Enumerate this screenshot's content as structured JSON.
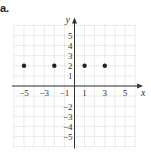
{
  "problem_label": "a.",
  "chart_data": {
    "type": "scatter",
    "title": "",
    "xlabel": "x",
    "ylabel": "y",
    "xlim": [
      -6,
      6
    ],
    "ylim": [
      -6,
      6
    ],
    "grid": true,
    "x_ticks": [
      -5,
      -3,
      -1,
      1,
      3,
      5
    ],
    "x_tick_labels": [
      "−5",
      "−3",
      "−1",
      "1",
      "3",
      "5"
    ],
    "y_ticks": [
      5,
      4,
      3,
      2,
      1,
      -2,
      -3,
      -4,
      -5
    ],
    "y_tick_labels": [
      "5",
      "4",
      "3",
      "2",
      "1",
      "−2",
      "−3",
      "−4",
      "−5"
    ],
    "series": [
      {
        "name": "points",
        "x": [
          -5,
          -2,
          1,
          3
        ],
        "y": [
          2,
          2,
          2,
          2
        ]
      }
    ],
    "colors": {
      "grid": "#bbbbbb",
      "axis": "#333333",
      "point": "#222222"
    }
  }
}
